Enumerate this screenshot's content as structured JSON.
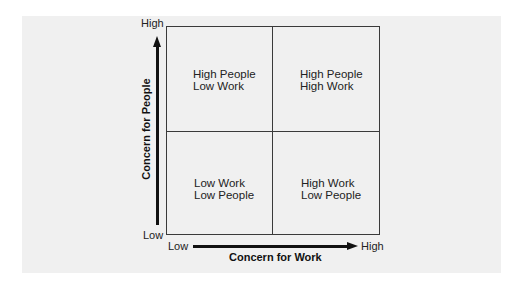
{
  "diagram": {
    "type": "2x2 matrix",
    "x_axis": {
      "label": "Concern for Work",
      "low": "Low",
      "high": "High"
    },
    "y_axis": {
      "label": "Concern for People",
      "low": "Low",
      "high": "High"
    },
    "quadrants": {
      "top_left": {
        "line1": "High People",
        "line2": "Low Work"
      },
      "top_right": {
        "line1": "High People",
        "line2": "High Work"
      },
      "bottom_left": {
        "line1": "Low Work",
        "line2": "Low People"
      },
      "bottom_right": {
        "line1": "High Work",
        "line2": "Low People"
      }
    }
  }
}
